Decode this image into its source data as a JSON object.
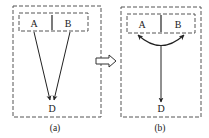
{
  "diagram": {
    "panel_a": {
      "node_a": "A",
      "node_b": "B",
      "node_d": "D",
      "caption": "(a)",
      "edges": [
        {
          "from": "A",
          "to": "D"
        },
        {
          "from": "B",
          "to": "D"
        }
      ]
    },
    "transform_arrow": "hollow-right-arrow",
    "panel_b": {
      "node_a": "A",
      "node_b": "B",
      "node_d": "D",
      "caption": "(b)",
      "edges": [
        {
          "from": "A+B merged",
          "to": "D"
        }
      ],
      "merge_arc": "curved connector joining A and B"
    },
    "colors": {
      "stroke": "#333333",
      "dashed_border": "#555555",
      "background": "#ffffff"
    }
  }
}
